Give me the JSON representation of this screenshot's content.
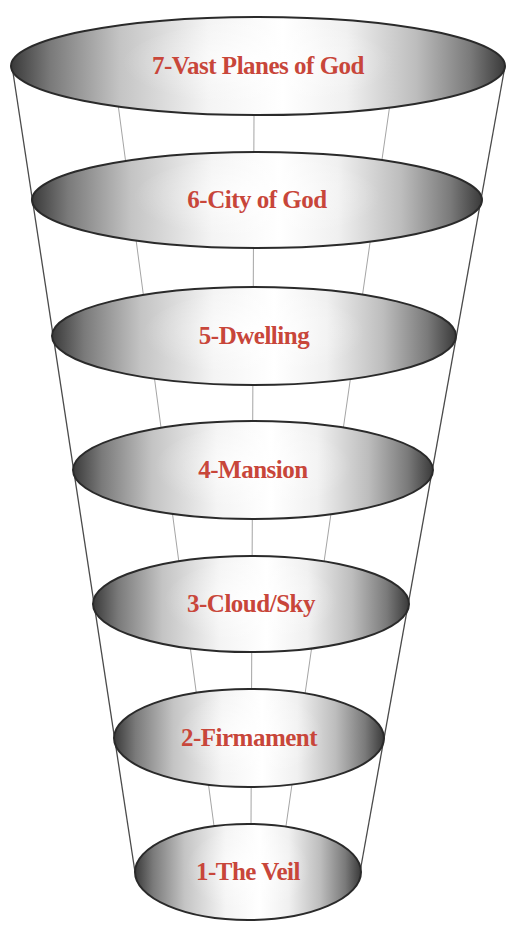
{
  "diagram": {
    "type": "cone-of-levels",
    "label_color": "#c8463a",
    "outline_color": "#2a2a2a",
    "guide_line_color": "#9a9a9a",
    "levels": [
      {
        "number": 7,
        "label": "7-Vast Planes of God",
        "cx": 258,
        "cy": 66,
        "rx": 247,
        "ry": 49
      },
      {
        "number": 6,
        "label": "6-City of God",
        "cx": 257,
        "cy": 200,
        "rx": 225,
        "ry": 48
      },
      {
        "number": 5,
        "label": "5-Dwelling",
        "cx": 254,
        "cy": 336,
        "rx": 202,
        "ry": 49
      },
      {
        "number": 4,
        "label": "4-Mansion",
        "cx": 253,
        "cy": 470,
        "rx": 180,
        "ry": 49
      },
      {
        "number": 3,
        "label": "3-Cloud/Sky",
        "cx": 251,
        "cy": 604,
        "rx": 158,
        "ry": 48
      },
      {
        "number": 2,
        "label": "2-Firmament",
        "cx": 249,
        "cy": 738,
        "rx": 135,
        "ry": 49
      },
      {
        "number": 1,
        "label": "1-The Veil",
        "cx": 248,
        "cy": 872,
        "rx": 113,
        "ry": 48
      }
    ],
    "outer_lines": [
      {
        "x1": 12,
        "y1": 66,
        "x2": 135,
        "y2": 872
      },
      {
        "x1": 505,
        "y1": 66,
        "x2": 360,
        "y2": 872
      }
    ],
    "inner_lines": [
      {
        "x1": 118,
        "y1": 104,
        "x2": 214,
        "y2": 826
      },
      {
        "x1": 254,
        "y1": 115,
        "x2": 251,
        "y2": 826
      },
      {
        "x1": 390,
        "y1": 104,
        "x2": 286,
        "y2": 826
      }
    ]
  }
}
